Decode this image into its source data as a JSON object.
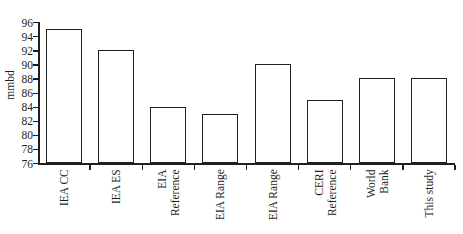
{
  "chart_data": {
    "type": "bar",
    "ylabel": "mmbd",
    "xlabel": "",
    "ylim": [
      76,
      96
    ],
    "ytick_interval": 2,
    "ytick_labels": [
      "76",
      "78",
      "80",
      "82",
      "84",
      "86",
      "88",
      "90",
      "92",
      "94",
      "96"
    ],
    "categories": [
      "IEA CC",
      "IEA ES",
      "EIA Reference",
      "EIA Range",
      "EIA Range",
      "CERI Reference",
      "World Bank",
      "This study"
    ],
    "category_label_lines": [
      [
        "IEA CC"
      ],
      [
        "IEA ES"
      ],
      [
        "EIA",
        "Reference"
      ],
      [
        "EIA Range"
      ],
      [
        "EIA Range"
      ],
      [
        "CERI",
        "Reference"
      ],
      [
        "World",
        "Bank"
      ],
      [
        "This study"
      ]
    ],
    "values": [
      95,
      92,
      84,
      83,
      90,
      85,
      88,
      88
    ],
    "grid": false,
    "legend": "none",
    "bar_fill": "#ffffff",
    "bar_border": "#1f1f1f",
    "axis_color": "#1f1f1f"
  }
}
